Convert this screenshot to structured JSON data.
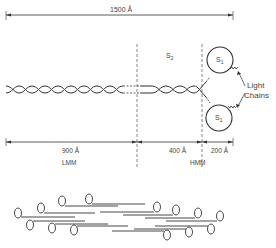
{
  "diagram": {
    "total_length": {
      "label": "1500 Å",
      "value": 1500,
      "unit": "Å"
    },
    "segments": [
      {
        "name": "LMM",
        "length_label": "900 Å",
        "value": 900
      },
      {
        "name": "S2",
        "length_label": "400 Å",
        "value": 400
      },
      {
        "name": "S1",
        "length_label": "200 Å",
        "value": 200
      }
    ],
    "labels": {
      "s2": "S",
      "s2_sub": "2",
      "s1_top": "S",
      "s1_top_sub": "1",
      "s1_bottom": "S",
      "s1_bottom_sub": "1",
      "light_chains_line1": "Light",
      "light_chains_line2": "Chains",
      "dim_900": "900 Å",
      "dim_400": "400 Å",
      "dim_200": "200 Å",
      "lmm": "LMM",
      "hmm": "HMM"
    },
    "filament": {
      "description": "bipolar thick filament assembled from myosin molecules"
    }
  }
}
